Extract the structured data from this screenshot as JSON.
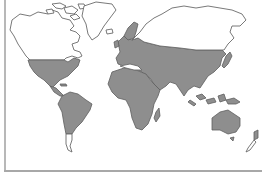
{
  "map": {
    "type": "world-distribution-map",
    "projection": "equirectangular-style outline",
    "shaded_color": "#8e8e8e",
    "outline_color": "#6a6a6a",
    "background_color": "#ffffff",
    "border_color": "#b0b0b0",
    "shaded_regions": [
      "southern North America / USA",
      "Mexico & Central America",
      "South America (except southern Patagonia)",
      "Europe",
      "Africa",
      "Middle East",
      "central & southern Asia",
      "Japan",
      "Southeast Asia & Indonesia",
      "New Guinea",
      "Australia",
      "Madagascar",
      "North Island of New Zealand"
    ],
    "unshaded_regions": [
      "Canada & Alaska",
      "Greenland",
      "Siberia / northern Asia",
      "southern Patagonia",
      "South Island of New Zealand"
    ]
  }
}
